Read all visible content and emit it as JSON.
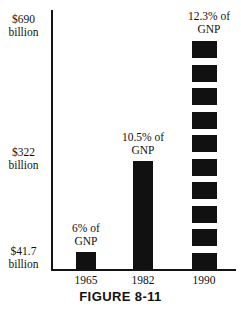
{
  "figure": {
    "caption": "FIGURE 8-11"
  },
  "axes": {
    "y_labels": [
      {
        "amount": "$690",
        "unit": "billion"
      },
      {
        "amount": "$322",
        "unit": "billion"
      },
      {
        "amount": "$41.7",
        "unit": "billion"
      }
    ],
    "x_labels": [
      "1965",
      "1982",
      "1990"
    ]
  },
  "callouts": [
    {
      "pct": "6% of",
      "gnp": "GNP"
    },
    {
      "pct": "10.5% of",
      "gnp": "GNP"
    },
    {
      "pct": "12.3% of",
      "gnp": "GNP"
    }
  ],
  "colors": {
    "bar": "#111111",
    "axis": "#141414",
    "background": "#ffffff",
    "text": "#111111"
  },
  "chart_data": {
    "type": "bar",
    "title": "FIGURE 8-11",
    "xlabel": "",
    "ylabel": "",
    "categories": [
      "1965",
      "1982",
      "1990"
    ],
    "values": [
      41.7,
      322,
      690
    ],
    "value_unit": "billion dollars",
    "ytick_labels": [
      "$41.7 billion",
      "$322 billion",
      "$690 billion"
    ],
    "ytick_values": [
      41.7,
      322,
      690
    ],
    "ylim": [
      0,
      690
    ],
    "grid": false,
    "legend": "none",
    "annotations": [
      {
        "category": "1965",
        "text": "6% of GNP",
        "value_pct_of_gnp": 6.0
      },
      {
        "category": "1982",
        "text": "10.5% of GNP",
        "value_pct_of_gnp": 10.5
      },
      {
        "category": "1990",
        "text": "12.3% of GNP",
        "value_pct_of_gnp": 12.3
      }
    ],
    "series": [
      {
        "name": "Amount",
        "values": [
          41.7,
          322,
          690
        ]
      },
      {
        "name": "Percent of GNP",
        "values": [
          6.0,
          10.5,
          12.3
        ]
      }
    ],
    "bar_styles": [
      "solid",
      "solid",
      "segmented"
    ],
    "segmented_bar_block_count": 10
  }
}
